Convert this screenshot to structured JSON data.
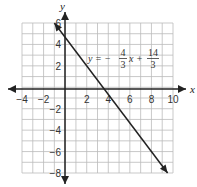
{
  "chart_data": {
    "type": "line",
    "title": "",
    "xlabel": "x",
    "ylabel": "y",
    "xlim": [
      -4,
      10
    ],
    "ylim": [
      -8,
      6
    ],
    "grid": true,
    "x_ticks": [
      "−4",
      "−2",
      "2",
      "4",
      "6",
      "8",
      "10"
    ],
    "y_ticks": [
      "6",
      "4",
      "2",
      "−2",
      "−4",
      "−6",
      "−8"
    ],
    "series": [
      {
        "name": "y = -4/3 x + 14/3",
        "slope": -1.3333,
        "intercept": 4.6667,
        "x": [
          -1,
          9.5
        ],
        "y": [
          6.0,
          -8.0
        ]
      }
    ],
    "annotation": {
      "lhs": "y = −",
      "frac1_num": "4",
      "frac1_den": "3",
      "mid": "x +",
      "frac2_num": "14",
      "frac2_den": "3"
    }
  }
}
